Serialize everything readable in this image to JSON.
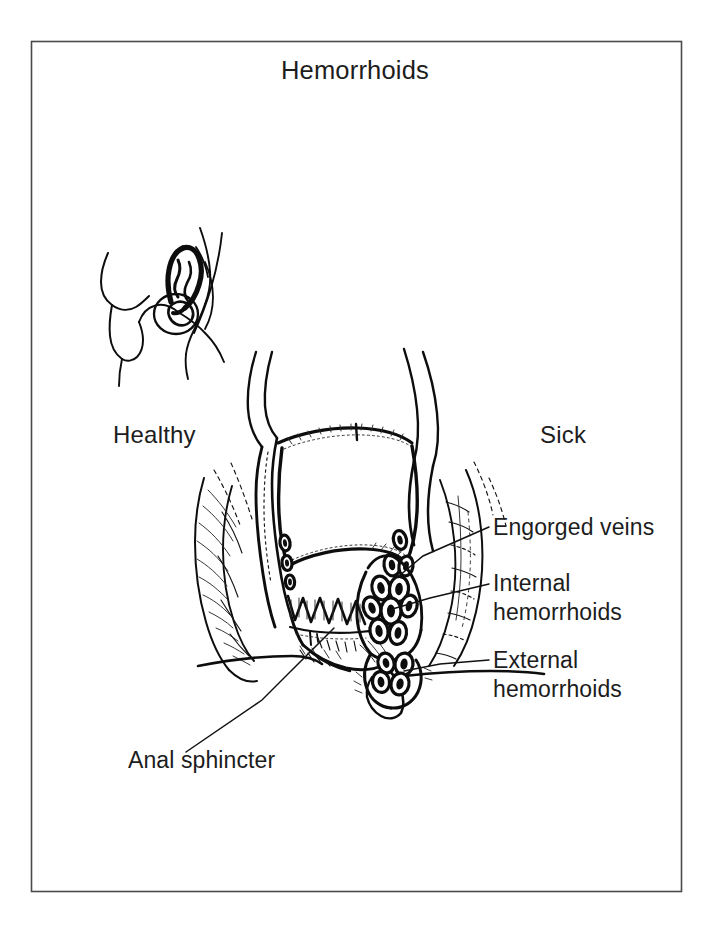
{
  "figure": {
    "title": "Hemorrhoids",
    "background_color": "#ffffff",
    "ink_color": "#0d0d0d",
    "frame_color": "#4a4a4a"
  },
  "captions": {
    "left": "Healthy",
    "right": "Sick"
  },
  "callouts": [
    {
      "id": "engorged-veins",
      "line1": "Engorged veins",
      "line2": ""
    },
    {
      "id": "internal-hemorrhoids",
      "line1": "Internal",
      "line2": "hemorrhoids"
    },
    {
      "id": "external-hemorrhoids",
      "line1": "External",
      "line2": "hemorrhoids"
    },
    {
      "id": "anal-sphincter",
      "line1": "Anal sphincter",
      "line2": ""
    }
  ],
  "illustrations": [
    {
      "id": "healthy-anatomy-sketch",
      "description": "small line drawing of healthy anorectal anatomy"
    },
    {
      "id": "diseased-anal-canal-cross-section",
      "description": "large cross-section of anal canal with hemorrhoids"
    }
  ]
}
